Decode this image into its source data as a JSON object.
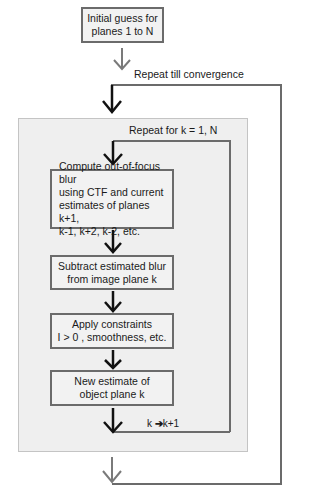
{
  "diagram": {
    "start_box": "Initial guess for\nplanes  1 to N",
    "outer_loop_label": "Repeat till convergence",
    "inner_loop_label": "Repeat for  k = 1, N",
    "steps": [
      {
        "text": "Compute out-of-focus blur\nusing CTF and current\nestimates of planes  k+1,\nk-1, k+2, k-2, etc."
      },
      {
        "text": "Subtract estimated blur\nfrom  image plane  k"
      },
      {
        "text": "Apply constraints\nI > 0 ,  smoothness, etc."
      },
      {
        "text": "New estimate of\nobject plane  k"
      }
    ],
    "increment_label_k": "k",
    "increment_label_next": "k+1",
    "colors": {
      "line": "#6b6b6b",
      "arrow_dark": "#111111",
      "arrow_light": "#7a7a7a",
      "box_fill": "#f2f2f2",
      "panel_fill": "#efefef"
    }
  }
}
